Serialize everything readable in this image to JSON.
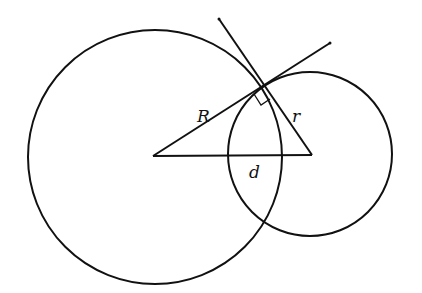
{
  "diagram": {
    "type": "geometry",
    "colors": {
      "stroke": "#111111",
      "background": "#ffffff"
    },
    "labels": {
      "big_radius": "R",
      "small_radius": "r",
      "center_distance": "d"
    },
    "big_circle": {
      "cx": 155,
      "cy": 157,
      "r": 127
    },
    "small_circle": {
      "cx": 310,
      "cy": 154,
      "r": 83
    },
    "tangent_point": {
      "x": 263,
      "y": 88
    },
    "right_angle_marker": true
  }
}
